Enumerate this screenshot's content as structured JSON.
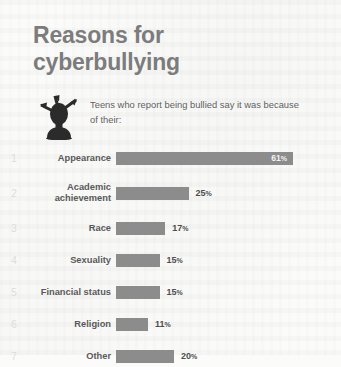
{
  "title": {
    "line1": "Reasons for",
    "line2": "cyberbullying"
  },
  "subtitle": "Teens who report being bullied say it was because of their:",
  "icon_name": "bullied-head-arrows-icon",
  "colors": {
    "title": "#7c7c7c",
    "bar": "#8c8c8c",
    "label": "#595959",
    "rank": "#dddcda",
    "background": "#fbfbfa"
  },
  "percent_symbol": "%",
  "chart_data": {
    "type": "bar",
    "title": "Reasons for cyberbullying",
    "subtitle": "Teens who report being bullied say it was because of their:",
    "xlabel": "",
    "ylabel": "",
    "xlim": [
      0,
      61
    ],
    "grid": false,
    "legend": false,
    "orientation": "horizontal",
    "unit": "%",
    "categories": [
      "Appearance",
      "Academic achievement",
      "Race",
      "Sexuality",
      "Financial status",
      "Religion",
      "Other"
    ],
    "values": [
      61,
      25,
      17,
      15,
      15,
      11,
      20
    ],
    "rows": [
      {
        "rank": "1",
        "label": "Appearance",
        "label_lines": [
          "Appearance"
        ],
        "value": 61,
        "value_text": "61",
        "label_inside_bar": true
      },
      {
        "rank": "2",
        "label": "Academic achievement",
        "label_lines": [
          "Academic",
          "achievement"
        ],
        "value": 25,
        "value_text": "25",
        "label_inside_bar": false
      },
      {
        "rank": "3",
        "label": "Race",
        "label_lines": [
          "Race"
        ],
        "value": 17,
        "value_text": "17",
        "label_inside_bar": false
      },
      {
        "rank": "4",
        "label": "Sexuality",
        "label_lines": [
          "Sexuality"
        ],
        "value": 15,
        "value_text": "15",
        "label_inside_bar": false
      },
      {
        "rank": "5",
        "label": "Financial status",
        "label_lines": [
          "Financial status"
        ],
        "value": 15,
        "value_text": "15",
        "label_inside_bar": false
      },
      {
        "rank": "6",
        "label": "Religion",
        "label_lines": [
          "Religion"
        ],
        "value": 11,
        "value_text": "11",
        "label_inside_bar": false
      },
      {
        "rank": "7",
        "label": "Other",
        "label_lines": [
          "Other"
        ],
        "value": 20,
        "value_text": "20",
        "label_inside_bar": false
      }
    ]
  }
}
